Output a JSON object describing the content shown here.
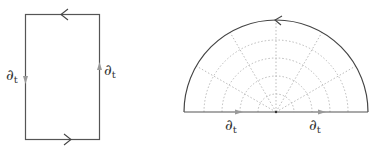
{
  "diagram": {
    "rectangle": {
      "left_label": "∂",
      "left_sub": "t",
      "right_label": "∂",
      "right_sub": "t"
    },
    "semicircle": {
      "left_label": "∂",
      "left_sub": "t",
      "right_label": "∂",
      "right_sub": "t"
    },
    "colors": {
      "outline": "#444444",
      "arrow_gray": "#999999",
      "grid": "#aaaaaa"
    }
  }
}
